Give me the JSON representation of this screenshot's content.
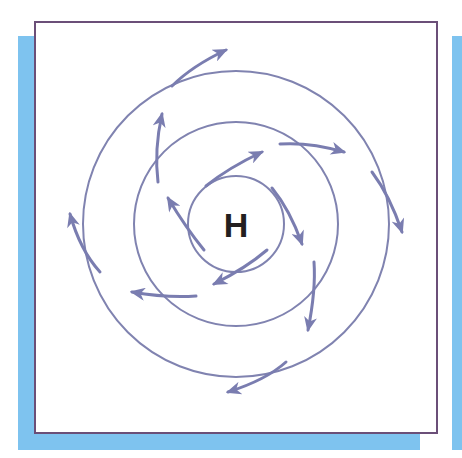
{
  "diagram": {
    "center_label": "H",
    "colors": {
      "frame_border": "#6b4f78",
      "shadow_strip": "#7ec3ef",
      "isobar": "#8083b0",
      "arrow": "#7a7db0",
      "label": "#231f20"
    },
    "isobars": [
      {
        "name": "inner",
        "radius": 48
      },
      {
        "name": "middle",
        "radius": 102
      },
      {
        "name": "outer",
        "radius": 153
      }
    ],
    "arrow_count": 12
  }
}
